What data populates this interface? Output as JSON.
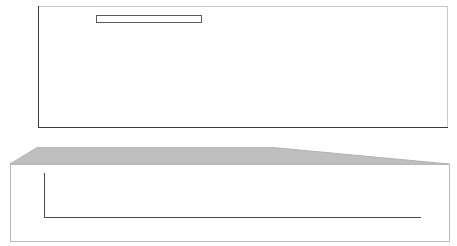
{
  "chart_data": [
    {
      "type": "bar",
      "id": "top-projection",
      "title": "",
      "xlabel": "",
      "ylabel": "Tidal Floods (Days/Year)",
      "xlim": [
        1920,
        2100
      ],
      "ylim": [
        0,
        400
      ],
      "yticks": [
        0,
        50,
        100,
        150,
        200,
        250,
        300,
        350,
        400
      ],
      "xticks": [
        1920,
        1940,
        1960,
        1980,
        2000,
        2020,
        2040,
        2060,
        2080,
        2100
      ],
      "grid": true,
      "legend_position": "upper-left",
      "legend": [
        {
          "label": "Higher Emissions",
          "color": "#1b1b1b"
        },
        {
          "label": "Lower Emissions",
          "color": "#bfbfbf"
        },
        {
          "label": "Observed",
          "color": "#8e8e8e"
        }
      ],
      "series": [
        {
          "name": "Observed",
          "color": "#8e8e8e",
          "x": [
            1920,
            1921,
            1922,
            1923,
            1924,
            1925,
            1926,
            1927,
            1928,
            1929,
            1930,
            1931,
            1932,
            1933,
            1934,
            1935,
            1936,
            1937,
            1938,
            1939,
            1940,
            1941,
            1942,
            1943,
            1944,
            1945,
            1946,
            1947,
            1948,
            1949,
            1950,
            1951,
            1952,
            1953,
            1954,
            1955,
            1956,
            1957,
            1958,
            1959,
            1960,
            1961,
            1962,
            1963,
            1964,
            1965,
            1966,
            1967,
            1968,
            1969,
            1970,
            1971,
            1972,
            1973,
            1974,
            1975,
            1976,
            1977,
            1978,
            1979,
            1980,
            1981,
            1982,
            1983,
            1984,
            1985,
            1986,
            1987,
            1988,
            1989,
            1990,
            1991,
            1992,
            1993,
            1994,
            1995,
            1996,
            1997,
            1998,
            1999,
            2000,
            2001,
            2002,
            2003,
            2004,
            2005,
            2006,
            2007,
            2008,
            2009,
            2010,
            2011,
            2012,
            2013,
            2014,
            2015
          ],
          "values": [
            0,
            0,
            0,
            0,
            0,
            0,
            0,
            0,
            0,
            0,
            0,
            0,
            0,
            0,
            0,
            0,
            0,
            0,
            0,
            0,
            0,
            0,
            0,
            1,
            1,
            4,
            1,
            1,
            0,
            1,
            1,
            1,
            0,
            2,
            1,
            1,
            2,
            1,
            1,
            1,
            1,
            1,
            2,
            1,
            0,
            1,
            1,
            1,
            1,
            2,
            1,
            2,
            3,
            5,
            4,
            3,
            1,
            2,
            3,
            2,
            2,
            2,
            3,
            9,
            6,
            4,
            2,
            3,
            2,
            3,
            3,
            5,
            2,
            3,
            4,
            6,
            12,
            9,
            4,
            7,
            13,
            6,
            5,
            9,
            12,
            6,
            14,
            9,
            7,
            18,
            16,
            13,
            11,
            20,
            22,
            30
          ]
        },
        {
          "name": "Lower Emissions",
          "color": "#a6a6a6",
          "x": [
            2016,
            2020,
            2024,
            2028,
            2032,
            2036,
            2040,
            2044,
            2048,
            2052,
            2056,
            2060,
            2064,
            2068,
            2072,
            2076,
            2080,
            2084,
            2088,
            2092,
            2096,
            2100
          ],
          "values": [
            32,
            40,
            52,
            68,
            90,
            120,
            158,
            200,
            240,
            275,
            302,
            322,
            334,
            342,
            348,
            351,
            353,
            354,
            355,
            355,
            356,
            356
          ]
        },
        {
          "name": "Higher Emissions",
          "color": "#1b1b1b",
          "note": "upper band plotted above the Lower Emissions curve",
          "x": [
            2016,
            2020,
            2024,
            2028,
            2032,
            2036,
            2040,
            2044,
            2048,
            2052,
            2056,
            2060,
            2064,
            2068,
            2072,
            2076,
            2080,
            2084,
            2088,
            2092,
            2096,
            2100
          ],
          "values": [
            33,
            42,
            56,
            74,
            100,
            136,
            180,
            225,
            262,
            292,
            316,
            332,
            342,
            349,
            353,
            356,
            357,
            358,
            359,
            359,
            360,
            360
          ]
        }
      ]
    },
    {
      "type": "bar",
      "id": "bottom-inset",
      "title": "",
      "xlabel": "",
      "ylabel": "",
      "xlim": [
        1920,
        2020
      ],
      "ylim": [
        0,
        100
      ],
      "yticks": [
        0,
        50,
        100
      ],
      "xticks": [
        1920,
        1940,
        1960,
        1980,
        2000,
        2020
      ],
      "grid": true,
      "series": [
        {
          "name": "Observed",
          "color": "#8e8e8e",
          "x": [
            1920,
            1921,
            1922,
            1923,
            1924,
            1925,
            1926,
            1927,
            1928,
            1929,
            1930,
            1931,
            1932,
            1933,
            1934,
            1935,
            1936,
            1937,
            1938,
            1939,
            1940,
            1941,
            1942,
            1943,
            1944,
            1945,
            1946,
            1947,
            1948,
            1949,
            1950,
            1951,
            1952,
            1953,
            1954,
            1955,
            1956,
            1957,
            1958,
            1959,
            1960,
            1961,
            1962,
            1963,
            1964,
            1965,
            1966,
            1967,
            1968,
            1969,
            1970,
            1971,
            1972,
            1973,
            1974,
            1975,
            1976,
            1977,
            1978,
            1979,
            1980,
            1981,
            1982,
            1983,
            1984,
            1985,
            1986,
            1987,
            1988,
            1989,
            1990,
            1991,
            1992,
            1993,
            1994,
            1995,
            1996,
            1997,
            1998,
            1999,
            2000,
            2001,
            2002,
            2003,
            2004,
            2005,
            2006,
            2007,
            2008,
            2009,
            2010,
            2011,
            2012,
            2013,
            2014,
            2015
          ],
          "values": [
            0,
            0,
            0,
            0,
            0,
            0,
            0,
            0,
            0,
            0,
            0,
            0,
            0,
            0,
            0,
            0,
            0,
            0,
            0,
            0,
            0,
            0,
            0,
            2,
            3,
            9,
            2,
            2,
            0,
            3,
            2,
            3,
            0,
            5,
            2,
            2,
            4,
            2,
            2,
            2,
            2,
            3,
            5,
            2,
            0,
            2,
            3,
            2,
            2,
            4,
            3,
            5,
            7,
            13,
            10,
            7,
            3,
            5,
            7,
            5,
            5,
            6,
            8,
            24,
            15,
            10,
            5,
            8,
            5,
            8,
            8,
            13,
            5,
            7,
            11,
            16,
            31,
            23,
            10,
            18,
            34,
            16,
            13,
            23,
            31,
            16,
            36,
            23,
            18,
            47,
            42,
            34,
            28,
            52,
            58,
            88
          ]
        }
      ]
    }
  ]
}
